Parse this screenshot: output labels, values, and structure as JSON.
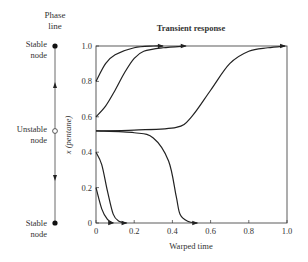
{
  "phase_line": {
    "title_line1": "Phase",
    "title_line2": "line",
    "top_label_1": "Stable",
    "top_label_2": "node",
    "mid_label_1": "Unstable",
    "mid_label_2": "node",
    "bottom_label_1": "Stable",
    "bottom_label_2": "node"
  },
  "chart_data": {
    "type": "line",
    "title": "Transient response",
    "xlabel": "Warped time",
    "ylabel": "x (pentane)",
    "xlim": [
      0,
      1.0
    ],
    "ylim": [
      0,
      1.0
    ],
    "xticks": [
      "0",
      "0.2",
      "0.4",
      "0.6",
      "0.8",
      "1.0"
    ],
    "yticks": [
      "0",
      "0.2",
      "0.4",
      "0.6",
      "0.8",
      "1.0"
    ],
    "grid": false,
    "series": [
      {
        "name": "x0=0.8",
        "x": [
          0,
          0.05,
          0.1,
          0.2,
          0.3,
          0.35
        ],
        "y": [
          0.8,
          0.9,
          0.95,
          0.99,
          1.0,
          1.0
        ]
      },
      {
        "name": "x0=0.6",
        "x": [
          0,
          0.05,
          0.1,
          0.15,
          0.2,
          0.25,
          0.35,
          0.47
        ],
        "y": [
          0.6,
          0.66,
          0.75,
          0.85,
          0.93,
          0.97,
          0.99,
          1.0
        ]
      },
      {
        "name": "x0=0.52 up",
        "x": [
          0,
          0.2,
          0.42,
          0.5,
          0.6,
          0.7,
          0.8,
          0.9,
          0.99
        ],
        "y": [
          0.52,
          0.525,
          0.54,
          0.6,
          0.75,
          0.9,
          0.97,
          0.99,
          1.0
        ]
      },
      {
        "name": "x0=0.52 down",
        "x": [
          0,
          0.2,
          0.3,
          0.38,
          0.42,
          0.44,
          0.48,
          0.53
        ],
        "y": [
          0.52,
          0.51,
          0.48,
          0.35,
          0.15,
          0.05,
          0.01,
          0.0
        ]
      },
      {
        "name": "x0=0.4",
        "x": [
          0,
          0.03,
          0.06,
          0.09,
          0.12,
          0.16
        ],
        "y": [
          0.4,
          0.33,
          0.18,
          0.05,
          0.01,
          0.0
        ]
      },
      {
        "name": "x0=0.2",
        "x": [
          0,
          0.03,
          0.06,
          0.09
        ],
        "y": [
          0.2,
          0.08,
          0.02,
          0.0
        ]
      }
    ]
  }
}
